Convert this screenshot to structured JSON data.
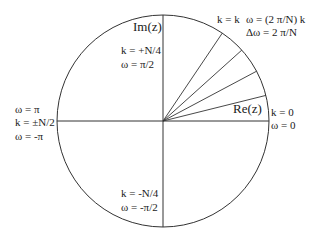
{
  "diagram": {
    "center": {
      "x": 163,
      "y": 121
    },
    "radius": 106,
    "stroke_color": "#333333",
    "radial_angles_deg": [
      14,
      28,
      42,
      56
    ],
    "axes": {
      "imag_label": "Im(z)",
      "real_label": "Re(z)"
    },
    "annotations": {
      "top": {
        "k": "k = +N/4",
        "w": "ω = π/2"
      },
      "bottom": {
        "k": "k = -N/4",
        "w": "ω = -π/2"
      },
      "right": {
        "k": "k = 0",
        "w": "ω = 0"
      },
      "left": {
        "w_pos": "ω = π",
        "k": "k = ±N/2",
        "w_neg": "ω = -π"
      },
      "general": {
        "k": "k = k",
        "w": "ω = (2 π/N) k",
        "dw": "Δω = 2 π/N"
      }
    }
  }
}
